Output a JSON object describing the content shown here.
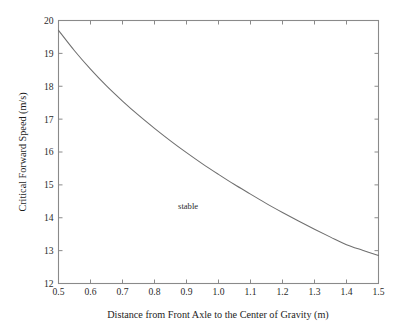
{
  "figure": {
    "background_color": "#ffffff",
    "width": 405,
    "height": 331
  },
  "chart_data": {
    "type": "line",
    "title": "",
    "subtitle": "",
    "xlabel": "Distance from Front Axle to the Center of Gravity (m)",
    "ylabel": "Critical Forward Speed (m/s)",
    "xlim": [
      0.5,
      1.5
    ],
    "ylim": [
      12,
      20
    ],
    "xticks": [
      0.5,
      0.6,
      0.7,
      0.8,
      0.9,
      1.0,
      1.1,
      1.2,
      1.3,
      1.4,
      1.5
    ],
    "xtick_labels": [
      "0.5",
      "0.6",
      "0.7",
      "0.8",
      "0.9",
      "1.0",
      "1.1",
      "1.2",
      "1.3",
      "1.4",
      "1.5"
    ],
    "yticks": [
      12,
      13,
      14,
      15,
      16,
      17,
      18,
      19,
      20
    ],
    "ytick_labels": [
      "12",
      "13",
      "14",
      "15",
      "16",
      "17",
      "18",
      "19",
      "20"
    ],
    "grid": false,
    "legend": null,
    "legend_position": "none",
    "tick_direction": "in",
    "line_color": "#6f6f6f",
    "axis_color": "#8a8a8a",
    "annotations": [
      {
        "text": "stable",
        "x": 0.905,
        "y": 14.28
      }
    ],
    "series": [
      {
        "name": "Critical Forward Speed",
        "x": [
          0.5,
          0.55,
          0.6,
          0.65,
          0.7,
          0.75,
          0.8,
          0.85,
          0.9,
          0.95,
          1.0,
          1.05,
          1.1,
          1.15,
          1.2,
          1.25,
          1.3,
          1.35,
          1.4,
          1.45,
          1.5
        ],
        "values": [
          19.7,
          19.08,
          18.52,
          18.01,
          17.55,
          17.12,
          16.72,
          16.34,
          15.98,
          15.64,
          15.32,
          15.01,
          14.72,
          14.43,
          14.16,
          13.9,
          13.65,
          13.41,
          13.18,
          13.01,
          12.85
        ]
      }
    ]
  },
  "axis_titles": {
    "x": "Distance from Front Axle to the Center of Gravity (m)",
    "y": "Critical Forward Speed (m/s)"
  },
  "annotation": {
    "stable_label": "stable"
  }
}
